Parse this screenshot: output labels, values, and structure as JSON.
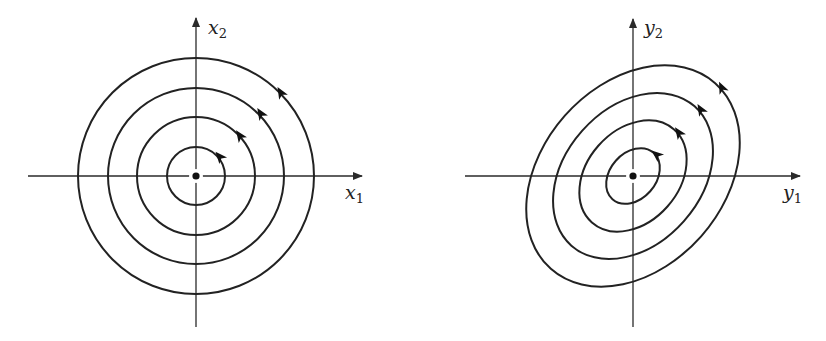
{
  "panels": [
    {
      "id": "left",
      "title": "circular orbits",
      "x_label": {
        "base": "x",
        "sub": "1"
      },
      "y_label": {
        "base": "x",
        "sub": "2"
      },
      "center": [
        196,
        176
      ],
      "axis_h": [
        28,
        363
      ],
      "axis_v": [
        17,
        327
      ],
      "orbits": [
        {
          "rx": 29,
          "ry": 29,
          "rot": 0
        },
        {
          "rx": 59,
          "ry": 59,
          "rot": 0
        },
        {
          "rx": 88,
          "ry": 88,
          "rot": 0
        },
        {
          "rx": 118,
          "ry": 118,
          "rot": 0
        }
      ],
      "arrows": [
        {
          "x": 220,
          "y": 157,
          "angle": -130
        },
        {
          "x": 240,
          "y": 136,
          "angle": -125
        },
        {
          "x": 261,
          "y": 114,
          "angle": -122
        },
        {
          "x": 281,
          "y": 93,
          "angle": -120
        }
      ],
      "direction": "counterclockwise"
    },
    {
      "id": "right",
      "title": "elliptical orbits",
      "x_label": {
        "base": "y",
        "sub": "1"
      },
      "y_label": {
        "base": "y",
        "sub": "2"
      },
      "center": [
        633,
        176
      ],
      "axis_h": [
        465,
        801
      ],
      "axis_v": [
        18,
        327
      ],
      "orbits": [
        {
          "rx": 31,
          "ry": 23,
          "rot": -48.5
        },
        {
          "rx": 62,
          "ry": 46,
          "rot": -48.5
        },
        {
          "rx": 93,
          "ry": 68,
          "rot": -48.5
        },
        {
          "rx": 124,
          "ry": 91,
          "rot": -48.5
        }
      ],
      "arrows": [
        {
          "x": 657,
          "y": 155,
          "angle": -140
        },
        {
          "x": 679,
          "y": 133,
          "angle": -125
        },
        {
          "x": 701,
          "y": 110,
          "angle": -120
        },
        {
          "x": 722,
          "y": 88,
          "angle": -115
        }
      ],
      "direction": "counterclockwise"
    }
  ],
  "colors": {
    "ink": "#222222",
    "background": "#ffffff"
  }
}
